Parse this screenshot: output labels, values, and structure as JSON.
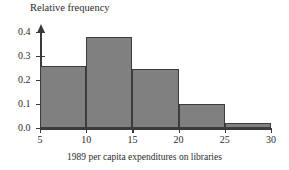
{
  "chart_data": {
    "type": "bar",
    "title": "",
    "subtitle": "",
    "xlabel": "1989 per capita expenditures on libraries",
    "ylabel": "Relative frequency",
    "grid": false,
    "legend": false,
    "legend_position": "none",
    "bin_edges": [
      5,
      10,
      15,
      20,
      25,
      30
    ],
    "categories": [
      "5-10",
      "10-15",
      "15-20",
      "20-25",
      "25-30"
    ],
    "values": [
      0.26,
      0.38,
      0.245,
      0.1,
      0.02
    ],
    "xlim": [
      5,
      30
    ],
    "ylim": [
      0.0,
      0.45
    ],
    "xticks": [
      5,
      10,
      15,
      20,
      25,
      30
    ],
    "xtick_labels": [
      "5",
      "10",
      "15",
      "20",
      "25",
      "30"
    ],
    "yticks": [
      0.0,
      0.1,
      0.2,
      0.3,
      0.4
    ],
    "ytick_labels": [
      "0.0",
      "0.1",
      "0.2",
      "0.3",
      "0.4"
    ],
    "bar_fill_color": "#808080",
    "bar_edge_color": "#3c3c3c",
    "axis_color": "#3a3a3a",
    "background_color": "#ffffff"
  }
}
